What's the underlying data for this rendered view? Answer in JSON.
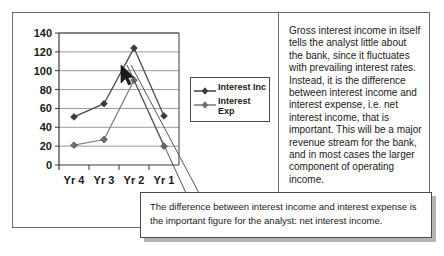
{
  "chart_data": {
    "type": "line",
    "title": "",
    "xlabel": "",
    "ylabel": "",
    "categories": [
      "Yr 4",
      "Yr 3",
      "Yr 2",
      "Yr 1"
    ],
    "ylim": [
      0,
      140
    ],
    "yticks": [
      0,
      20,
      40,
      60,
      80,
      100,
      120,
      140
    ],
    "ytick_labels": [
      "0",
      "20",
      "40",
      "60",
      "80",
      "100",
      "120",
      "140"
    ],
    "grid": true,
    "legend_position": "right",
    "series": [
      {
        "name": "Interest Inc",
        "label_lines": "Interest Inc",
        "color": "#4d4d4d",
        "marker": "diamond",
        "values": [
          51,
          65,
          124,
          52
        ]
      },
      {
        "name": "Interest Exp",
        "label_lines": "Interest\nExp",
        "color": "#808080",
        "marker": "diamond",
        "values": [
          21,
          27,
          90,
          20
        ]
      }
    ]
  },
  "explanation": {
    "body": "Gross interest income in itself tells the analyst little about the bank, since it fluctuates with prevailing interest rates. Instead, it is the difference between interest income and interest expense, i.e. net interest income, that is important. This will be a major revenue stream for the bank, and in most cases the larger component of operating income."
  },
  "callout": {
    "body": "The difference between interest income and interest expense is the important figure for the analyst: net interest income."
  }
}
